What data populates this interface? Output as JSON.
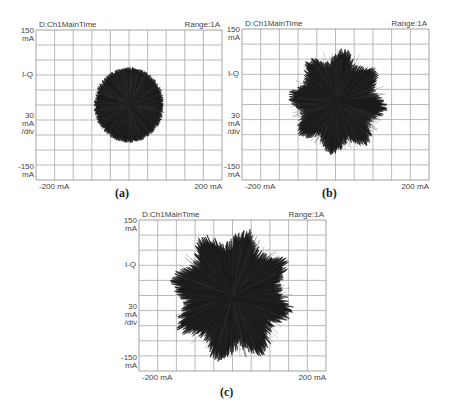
{
  "chart_data": [
    {
      "id": "a",
      "type": "scatter",
      "subtype": "IQ constellation / vector diagram",
      "caption": "(a)",
      "title_left": "D:Ch1MainTime",
      "title_right": "Range:1A",
      "y_top_label": [
        "150",
        "mA"
      ],
      "y_mid_label": "I-Q",
      "y_scale_label": [
        "30",
        "mA",
        "/div"
      ],
      "y_bottom_label": [
        "-150",
        "mA"
      ],
      "x_left_label": "-200 mA",
      "x_right_label": "200 mA",
      "xlim": [
        -200,
        200
      ],
      "ylim": [
        -150,
        150
      ],
      "grid": {
        "cols": 10,
        "rows": 10,
        "on": true
      },
      "blob": {
        "center_x_mA": 0,
        "center_y_mA": 0,
        "radius_mA": 70,
        "spike_mA": 8,
        "lobes": 0
      }
    },
    {
      "id": "b",
      "type": "scatter",
      "subtype": "IQ constellation / vector diagram",
      "caption": "(b)",
      "title_left": "D:Ch1MainTime",
      "title_right": "Range:1A",
      "y_top_label": [
        "150",
        "mA"
      ],
      "y_mid_label": "I-Q",
      "y_scale_label": [
        "30",
        "mA",
        "/div"
      ],
      "y_bottom_label": [
        "-150",
        "mA"
      ],
      "x_left_label": "-200 mA",
      "x_right_label": "200 mA",
      "xlim": [
        -200,
        200
      ],
      "ylim": [
        -150,
        150
      ],
      "grid": {
        "cols": 10,
        "rows": 10,
        "on": true
      },
      "blob": {
        "center_x_mA": 5,
        "center_y_mA": 5,
        "radius_mA": 95,
        "spike_mA": 18,
        "lobes": 8
      }
    },
    {
      "id": "c",
      "type": "scatter",
      "subtype": "IQ constellation / vector diagram",
      "caption": "(c)",
      "title_left": "D:Ch1MainTime",
      "title_right": "Range:1A",
      "y_top_label": [
        "150",
        "mA"
      ],
      "y_mid_label": "I-Q",
      "y_scale_label": [
        "30",
        "mA",
        "/div"
      ],
      "y_bottom_label": [
        "-150",
        "mA"
      ],
      "x_left_label": "-200 mA",
      "x_right_label": "200 mA",
      "xlim": [
        -200,
        200
      ],
      "ylim": [
        -150,
        150
      ],
      "grid": {
        "cols": 10,
        "rows": 10,
        "on": true
      },
      "blob": {
        "center_x_mA": 0,
        "center_y_mA": 0,
        "radius_mA": 120,
        "spike_mA": 25,
        "lobes": 8
      }
    }
  ],
  "layout": {
    "panels": [
      {
        "grid_x": 36,
        "grid_y": 30,
        "grid_w": 186,
        "grid_h": 150,
        "caption_x": 115,
        "caption_y": 186
      },
      {
        "grid_x": 242,
        "grid_y": 29,
        "grid_w": 187,
        "grid_h": 151,
        "caption_x": 322,
        "caption_y": 186
      },
      {
        "grid_x": 139,
        "grid_y": 220,
        "grid_w": 187,
        "grid_h": 151,
        "caption_x": 220,
        "caption_y": 385
      }
    ]
  },
  "colors": {
    "grid": "#a8a8a8",
    "border": "#8c8c8c",
    "trace": "#1a1a1a",
    "text": "#444444"
  }
}
